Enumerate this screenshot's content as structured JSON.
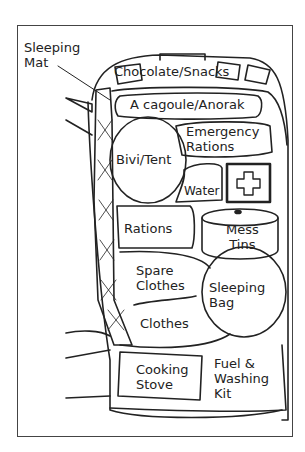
{
  "diagram": {
    "type": "rucksack-packing-layout",
    "callout": {
      "label": "Sleeping\nMat"
    },
    "compartments": [
      {
        "id": "chocolate-snacks",
        "label": "Chocolate/Snacks"
      },
      {
        "id": "cagoule",
        "label": "A cagoule/Anorak"
      },
      {
        "id": "emergency-rations",
        "label": "Emergency\nRations"
      },
      {
        "id": "bivi-tent",
        "label": "Bivi/Tent"
      },
      {
        "id": "water",
        "label": "Water"
      },
      {
        "id": "first-aid",
        "label": ""
      },
      {
        "id": "rations",
        "label": "Rations"
      },
      {
        "id": "mess-tins",
        "label": "Mess\nTins"
      },
      {
        "id": "spare-clothes",
        "label": "Spare\nClothes"
      },
      {
        "id": "sleeping-bag",
        "label": "Sleeping\nBag"
      },
      {
        "id": "clothes",
        "label": "Clothes"
      },
      {
        "id": "cooking-stove",
        "label": "Cooking\nStove"
      },
      {
        "id": "fuel-washing-kit",
        "label": "Fuel &\nWashing\nKit"
      }
    ]
  }
}
